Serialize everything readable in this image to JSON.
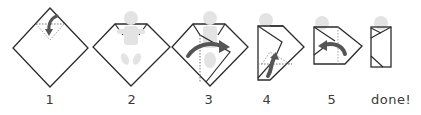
{
  "diagram": {
    "colors": {
      "outline": "#2b2b2b",
      "baby": "#e3e3e3",
      "arrow": "#555555",
      "fold_line": "#777777",
      "label": "#3a3a3a",
      "background": "#ffffff"
    },
    "steps": [
      {
        "label": "1",
        "description": "Blanket laid as diamond, top corner folded down"
      },
      {
        "label": "2",
        "description": "Baby placed on blanket with head above folded edge"
      },
      {
        "label": "3",
        "description": "Left corner wrapped across baby"
      },
      {
        "label": "4",
        "description": "Bottom corner folded up over feet"
      },
      {
        "label": "5",
        "description": "Right corner wrapped across"
      },
      {
        "label": "done!",
        "description": "Baby fully swaddled"
      }
    ]
  }
}
